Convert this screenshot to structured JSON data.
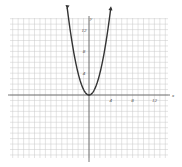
{
  "chart_data": {
    "type": "line",
    "title": "",
    "function": "y = x^2",
    "xlabel": "x",
    "ylabel": "y",
    "xlim": [
      -14,
      14
    ],
    "ylim": [
      -12,
      14
    ],
    "x_ticks": [
      4,
      8,
      12
    ],
    "y_ticks": [
      4,
      8,
      12
    ],
    "x_tick_labels": [
      "4",
      "8",
      "12"
    ],
    "y_tick_labels": [
      "4",
      "8",
      "12"
    ],
    "grid": true,
    "grid_step": 1,
    "series": [
      {
        "name": "parabola",
        "x": [
          -4,
          -3.5,
          -3,
          -2.5,
          -2,
          -1.5,
          -1,
          -0.5,
          0,
          0.5,
          1,
          1.5,
          2,
          2.5,
          3,
          3.5,
          4
        ],
        "values": [
          16,
          12.25,
          9,
          6.25,
          4,
          2.25,
          1,
          0.25,
          0,
          0.25,
          1,
          2.25,
          4,
          6.25,
          9,
          12.25,
          16
        ],
        "color": "#333333",
        "arrows_at_ends": true
      }
    ]
  },
  "axes": {
    "x_label": "x",
    "y_label": "y"
  },
  "colors": {
    "grid": "#c8c8c8",
    "axis": "#555555",
    "curve": "#333333"
  }
}
